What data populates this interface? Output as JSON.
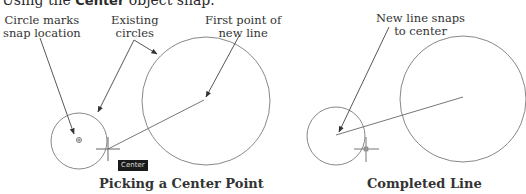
{
  "intro": {
    "prefix": "Using the ",
    "bold": "Center",
    "suffix": " object snap."
  },
  "left_panel": {
    "callouts": {
      "circle_marks": [
        "Circle marks",
        "snap location"
      ],
      "existing_circles": [
        "Existing",
        "circles"
      ],
      "first_point": [
        "First point of",
        "new line"
      ]
    },
    "tooltip": "Center",
    "caption": "Picking a Center Point"
  },
  "right_panel": {
    "callouts": {
      "new_line_snaps": [
        "New line snaps",
        "to center"
      ]
    },
    "caption": "Completed Line"
  },
  "colors": {
    "geometry": "#777777",
    "leader": "#444444",
    "tooltip_bg": "#1a1a1a"
  }
}
